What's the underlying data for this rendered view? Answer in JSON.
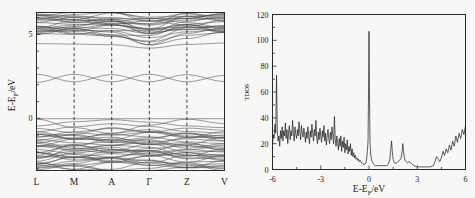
{
  "figure": {
    "background_color": "#f7f7f5",
    "line_color": "#4a4a4a",
    "axis_color": "#2b2b2b"
  },
  "chart_data": [
    {
      "type": "line",
      "id": "band-structure",
      "title": "",
      "xlabel": "",
      "ylabel": "E-E₅/eV",
      "ylabel_parts": {
        "pre": "E-E",
        "sub": "F",
        "post": "/eV"
      },
      "ylim": [
        -3.1,
        6.3
      ],
      "yticks": [
        0,
        5
      ],
      "ytick_labels": [
        "0",
        "5"
      ],
      "grid": false,
      "kpoints": [
        "L",
        "M",
        "A",
        "Γ",
        "Z",
        "V"
      ],
      "kpoint_positions": [
        0,
        1,
        2,
        3,
        4,
        5
      ],
      "dashed_verticals_at": [
        "M",
        "A",
        "Γ",
        "Z"
      ],
      "fermi_level": 0,
      "series": [
        {
          "name": "band-1",
          "values": [
            -2.95,
            -2.8,
            -2.6,
            -2.78,
            -2.95,
            -2.85
          ]
        },
        {
          "name": "band-2",
          "values": [
            -2.85,
            -2.55,
            -2.35,
            -2.5,
            -2.8,
            -2.7
          ]
        },
        {
          "name": "band-3",
          "values": [
            -2.7,
            -2.3,
            -2.1,
            -2.2,
            -2.6,
            -2.55
          ]
        },
        {
          "name": "band-4",
          "values": [
            -2.55,
            -2.05,
            -1.85,
            -1.95,
            -2.4,
            -2.35
          ]
        },
        {
          "name": "band-5",
          "values": [
            -2.4,
            -1.8,
            -1.6,
            -1.72,
            -2.2,
            -2.15
          ]
        },
        {
          "name": "band-6",
          "values": [
            -2.2,
            -1.55,
            -1.4,
            -1.5,
            -2.0,
            -1.95
          ]
        },
        {
          "name": "band-7",
          "values": [
            -2.05,
            -2.3,
            -2.5,
            -2.25,
            -2.05,
            -2.2
          ]
        },
        {
          "name": "band-8",
          "values": [
            -1.85,
            -2.1,
            -2.3,
            -2.05,
            -1.85,
            -2.0
          ]
        },
        {
          "name": "band-9",
          "values": [
            -1.65,
            -1.9,
            -2.05,
            -1.8,
            -1.62,
            -1.78
          ]
        },
        {
          "name": "band-10",
          "values": [
            -1.45,
            -1.15,
            -0.95,
            -1.1,
            -1.4,
            -1.5
          ]
        },
        {
          "name": "band-11",
          "values": [
            -1.25,
            -1.45,
            -1.6,
            -1.42,
            -1.22,
            -1.35
          ]
        },
        {
          "name": "band-12",
          "values": [
            -1.1,
            -0.8,
            -0.6,
            -0.78,
            -1.05,
            -1.15
          ]
        },
        {
          "name": "band-13",
          "values": [
            -0.95,
            -1.2,
            -1.35,
            -1.15,
            -0.92,
            -1.05
          ]
        },
        {
          "name": "band-14",
          "values": [
            -0.8,
            -0.5,
            -0.32,
            -0.48,
            -0.78,
            -0.88
          ]
        },
        {
          "name": "band-15",
          "values": [
            -0.6,
            -0.85,
            -1.0,
            -0.82,
            -0.58,
            -0.7
          ]
        },
        {
          "name": "band-16",
          "values": [
            -0.45,
            -0.2,
            -0.08,
            -0.22,
            -0.45,
            -0.55
          ]
        },
        {
          "name": "band-17",
          "values": [
            -0.05,
            -0.55,
            -0.9,
            -0.4,
            -0.05,
            -0.3
          ]
        },
        {
          "name": "band-18",
          "values": [
            -0.02,
            -0.02,
            -0.02,
            -0.02,
            -0.02,
            -0.02
          ]
        },
        {
          "name": "band-19",
          "values": [
            2.15,
            2.62,
            2.18,
            2.62,
            2.18,
            2.55
          ]
        },
        {
          "name": "band-20",
          "values": [
            2.62,
            2.18,
            2.6,
            2.18,
            2.6,
            2.2
          ]
        },
        {
          "name": "band-21",
          "values": [
            4.45,
            4.42,
            4.38,
            4.18,
            4.4,
            4.48
          ]
        },
        {
          "name": "band-22",
          "values": [
            5.05,
            5.0,
            4.9,
            4.55,
            4.95,
            5.1
          ]
        },
        {
          "name": "band-23",
          "values": [
            5.2,
            5.25,
            5.2,
            4.8,
            5.15,
            5.3
          ]
        },
        {
          "name": "band-24",
          "values": [
            5.45,
            5.4,
            5.35,
            5.05,
            5.4,
            5.5
          ]
        },
        {
          "name": "band-25",
          "values": [
            5.7,
            5.6,
            5.55,
            5.3,
            5.6,
            5.75
          ]
        },
        {
          "name": "band-26",
          "values": [
            5.95,
            5.85,
            5.78,
            5.55,
            5.85,
            5.98
          ]
        },
        {
          "name": "band-27",
          "values": [
            6.15,
            6.05,
            6.0,
            5.8,
            6.05,
            6.18
          ]
        },
        {
          "name": "band-28",
          "values": [
            5.35,
            5.55,
            5.75,
            5.95,
            5.7,
            5.4
          ]
        },
        {
          "name": "band-29",
          "values": [
            5.1,
            5.35,
            5.6,
            5.8,
            5.55,
            5.15
          ]
        },
        {
          "name": "band-30",
          "values": [
            6.2,
            6.1,
            5.9,
            5.6,
            5.95,
            6.22
          ]
        }
      ]
    },
    {
      "type": "line",
      "id": "tdos",
      "title": "",
      "xlabel": "E-E₅/eV",
      "xlabel_parts": {
        "pre": "E-E",
        "sub": "F",
        "post": "/eV"
      },
      "ylabel": "TDOS",
      "xlim": [
        -6,
        6
      ],
      "ylim": [
        0,
        120
      ],
      "xticks": [
        -6,
        -3,
        0,
        3,
        6
      ],
      "xtick_labels": [
        "-6",
        "-3",
        "0",
        "3",
        "6"
      ],
      "yticks": [
        0,
        20,
        40,
        60,
        80,
        100,
        120
      ],
      "ytick_labels": [
        "0",
        "20",
        "40",
        "60",
        "80",
        "100",
        "120"
      ],
      "grid": false,
      "fermi_peak_value": 107,
      "fermi_peak_position": 0,
      "x": [
        -6.0,
        -5.95,
        -5.9,
        -5.85,
        -5.8,
        -5.75,
        -5.7,
        -5.65,
        -5.6,
        -5.55,
        -5.5,
        -5.45,
        -5.4,
        -5.35,
        -5.3,
        -5.25,
        -5.2,
        -5.15,
        -5.1,
        -5.05,
        -5.0,
        -4.95,
        -4.9,
        -4.85,
        -4.8,
        -4.75,
        -4.7,
        -4.65,
        -4.6,
        -4.55,
        -4.5,
        -4.45,
        -4.4,
        -4.35,
        -4.3,
        -4.25,
        -4.2,
        -4.15,
        -4.1,
        -4.05,
        -4.0,
        -3.95,
        -3.9,
        -3.85,
        -3.8,
        -3.75,
        -3.7,
        -3.65,
        -3.6,
        -3.55,
        -3.5,
        -3.45,
        -3.4,
        -3.35,
        -3.3,
        -3.25,
        -3.2,
        -3.15,
        -3.1,
        -3.05,
        -3.0,
        -2.95,
        -2.9,
        -2.85,
        -2.8,
        -2.75,
        -2.7,
        -2.65,
        -2.6,
        -2.55,
        -2.5,
        -2.45,
        -2.4,
        -2.35,
        -2.3,
        -2.25,
        -2.2,
        -2.15,
        -2.1,
        -2.05,
        -2.0,
        -1.95,
        -1.9,
        -1.85,
        -1.8,
        -1.75,
        -1.7,
        -1.65,
        -1.6,
        -1.55,
        -1.5,
        -1.45,
        -1.4,
        -1.35,
        -1.3,
        -1.25,
        -1.2,
        -1.15,
        -1.1,
        -1.05,
        -1.0,
        -0.95,
        -0.9,
        -0.85,
        -0.8,
        -0.75,
        -0.7,
        -0.65,
        -0.6,
        -0.55,
        -0.5,
        -0.45,
        -0.4,
        -0.35,
        -0.3,
        -0.25,
        -0.2,
        -0.15,
        -0.1,
        -0.06,
        -0.03,
        0.0,
        0.03,
        0.06,
        0.1,
        0.15,
        0.2,
        0.3,
        0.4,
        0.5,
        0.6,
        0.7,
        0.8,
        0.9,
        1.0,
        1.1,
        1.2,
        1.3,
        1.35,
        1.4,
        1.45,
        1.5,
        1.55,
        1.6,
        1.7,
        1.8,
        1.9,
        2.0,
        2.05,
        2.1,
        2.15,
        2.2,
        2.25,
        2.3,
        2.4,
        2.5,
        2.6,
        2.7,
        2.8,
        3.0,
        3.2,
        3.4,
        3.6,
        3.8,
        4.0,
        4.1,
        4.2,
        4.3,
        4.4,
        4.5,
        4.6,
        4.7,
        4.8,
        4.9,
        5.0,
        5.1,
        5.2,
        5.3,
        5.4,
        5.5,
        5.6,
        5.7,
        5.8,
        5.9,
        6.0
      ],
      "values": [
        20,
        27,
        24,
        35,
        28,
        73,
        30,
        22,
        26,
        18,
        30,
        24,
        33,
        22,
        30,
        26,
        36,
        24,
        31,
        20,
        29,
        34,
        23,
        30,
        26,
        38,
        28,
        22,
        33,
        27,
        24,
        31,
        26,
        37,
        29,
        23,
        34,
        28,
        25,
        32,
        27,
        21,
        29,
        24,
        33,
        26,
        20,
        30,
        25,
        35,
        28,
        22,
        31,
        26,
        38,
        24,
        20,
        29,
        23,
        32,
        26,
        21,
        30,
        25,
        34,
        22,
        28,
        19,
        26,
        31,
        24,
        20,
        29,
        23,
        33,
        26,
        20,
        41,
        24,
        18,
        26,
        20,
        15,
        24,
        18,
        26,
        14,
        22,
        17,
        25,
        13,
        20,
        15,
        23,
        12,
        18,
        14,
        20,
        11,
        16,
        10,
        13,
        9,
        11,
        8,
        9,
        7,
        8,
        6,
        7,
        6,
        5,
        5,
        4,
        4,
        4,
        5,
        8,
        14,
        22,
        60,
        107,
        60,
        22,
        12,
        8,
        6,
        4,
        3,
        3,
        3,
        3,
        3,
        3,
        3,
        3,
        4,
        8,
        15,
        22,
        14,
        8,
        6,
        5,
        5,
        6,
        7,
        9,
        13,
        20,
        14,
        9,
        7,
        6,
        5,
        6,
        5,
        4,
        3,
        2,
        2,
        2,
        2,
        2,
        3,
        6,
        10,
        8,
        6,
        9,
        14,
        11,
        16,
        13,
        19,
        15,
        22,
        18,
        26,
        21,
        28,
        24,
        31,
        27,
        34
      ]
    }
  ]
}
